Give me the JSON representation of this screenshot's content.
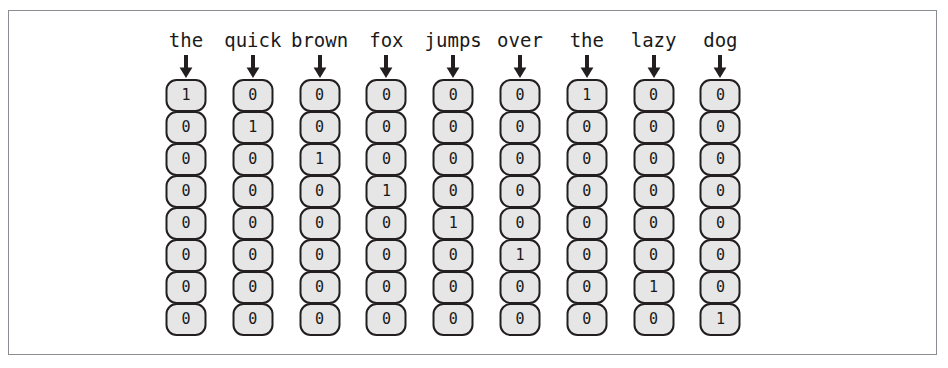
{
  "figure": {
    "kind": "one-hot-encoding-diagram",
    "frame_border_color": "#8a8d92",
    "cell_fill_color": "#e6e6e6",
    "cell_border_color": "#231f20",
    "text_color": "#1a1a1a",
    "background_color": "#ffffff",
    "arrow_glyph": "down-arrow",
    "sentence": "the quick brown fox jumps over the lazy dog",
    "num_columns": 9,
    "num_rows": 8,
    "columns": [
      {
        "label": "the",
        "values": [
          "1",
          "0",
          "0",
          "0",
          "0",
          "0",
          "0",
          "0"
        ]
      },
      {
        "label": "quick",
        "values": [
          "0",
          "1",
          "0",
          "0",
          "0",
          "0",
          "0",
          "0"
        ]
      },
      {
        "label": "brown",
        "values": [
          "0",
          "0",
          "1",
          "0",
          "0",
          "0",
          "0",
          "0"
        ]
      },
      {
        "label": "fox",
        "values": [
          "0",
          "0",
          "0",
          "1",
          "0",
          "0",
          "0",
          "0"
        ]
      },
      {
        "label": "jumps",
        "values": [
          "0",
          "0",
          "0",
          "0",
          "1",
          "0",
          "0",
          "0"
        ]
      },
      {
        "label": "over",
        "values": [
          "0",
          "0",
          "0",
          "0",
          "0",
          "1",
          "0",
          "0"
        ]
      },
      {
        "label": "the",
        "values": [
          "1",
          "0",
          "0",
          "0",
          "0",
          "0",
          "0",
          "0"
        ]
      },
      {
        "label": "lazy",
        "values": [
          "0",
          "0",
          "0",
          "0",
          "0",
          "0",
          "1",
          "0"
        ]
      },
      {
        "label": "dog",
        "values": [
          "0",
          "0",
          "0",
          "0",
          "0",
          "0",
          "0",
          "1"
        ]
      }
    ]
  }
}
